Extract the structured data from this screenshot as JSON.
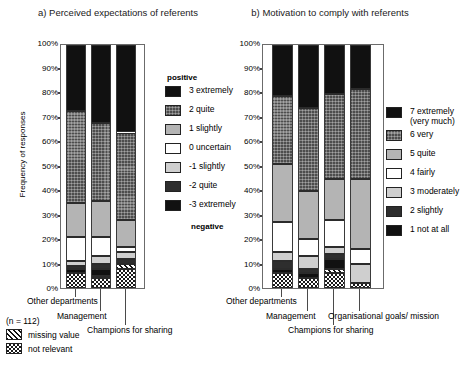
{
  "figure": {
    "y_axis_label": "Frequency of responses",
    "y_ticks": [
      "100%",
      "90%",
      "80%",
      "70%",
      "60%",
      "50%",
      "40%",
      "30%",
      "20%",
      "10%",
      "0%"
    ],
    "sample_size_note": "(n = 112)",
    "notes": [
      {
        "label": "missing value",
        "pattern": "hatched"
      },
      {
        "label": "not relevant",
        "pattern": "checkerboard"
      }
    ]
  },
  "panel_a": {
    "title": "a) Perceived expectations of referents",
    "legend": {
      "header": "positive",
      "footer": "negative",
      "items": [
        {
          "label": "3 extremely",
          "fill": "black"
        },
        {
          "label": "2 quite",
          "fill": "darkgray"
        },
        {
          "label": "1 slightly",
          "fill": "lightgray"
        },
        {
          "label": "0 uncertain",
          "fill": "white"
        },
        {
          "label": "-1 slightly",
          "fill": "paleglray"
        },
        {
          "label": "-2 quite",
          "fill": "vdark"
        },
        {
          "label": "-3 extremely",
          "fill": "black"
        }
      ]
    },
    "categories": [
      "Other departments",
      "Management",
      "Champions for sharing"
    ]
  },
  "panel_b": {
    "title": "b) Motivation  to comply with referents",
    "legend": {
      "items": [
        {
          "label": "7 extremely (very much)",
          "fill": "black"
        },
        {
          "label": "6 very",
          "fill": "darkgray"
        },
        {
          "label": "5 quite",
          "fill": "lightgray"
        },
        {
          "label": "4 fairly",
          "fill": "white"
        },
        {
          "label": "3 moderately",
          "fill": "paleglray"
        },
        {
          "label": "2 slightly",
          "fill": "vdark"
        },
        {
          "label": "1 not at all",
          "fill": "black"
        }
      ]
    },
    "categories": [
      "Other departments",
      "Management",
      "Champions for sharing",
      "Organisational goals/ mission"
    ]
  },
  "chart_data": [
    {
      "type": "bar",
      "id": "panel_a",
      "stacked": true,
      "percent": true,
      "title": "a) Perceived expectations of referents",
      "xlabel": "",
      "ylabel": "Frequency of responses",
      "ylim": [
        0,
        100
      ],
      "grid": false,
      "legend_position": "right",
      "legend_header": "positive",
      "legend_footer": "negative",
      "categories": [
        "Other departments",
        "Management",
        "Champions for sharing"
      ],
      "series": [
        {
          "name": "not relevant",
          "fill": "checkerboard",
          "values": [
            6,
            4,
            8
          ]
        },
        {
          "name": "missing value",
          "fill": "hatched",
          "values": [
            0,
            1,
            2
          ]
        },
        {
          "name": "-3 extremely",
          "fill": "black",
          "values": [
            2,
            3,
            0
          ]
        },
        {
          "name": "-2 quite",
          "fill": "vdark",
          "values": [
            1,
            2,
            2
          ]
        },
        {
          "name": "-1 slightly",
          "fill": "paleglray",
          "values": [
            2,
            3,
            3
          ]
        },
        {
          "name": "0 uncertain",
          "fill": "white",
          "values": [
            10,
            8,
            2
          ]
        },
        {
          "name": "1 slightly",
          "fill": "lightgray",
          "values": [
            14,
            15,
            11
          ]
        },
        {
          "name": "2 quite",
          "fill": "darkgray",
          "values": [
            38,
            32,
            36
          ]
        },
        {
          "name": "3 extremely",
          "fill": "black",
          "values": [
            27,
            32,
            36
          ]
        }
      ]
    },
    {
      "type": "bar",
      "id": "panel_b",
      "stacked": true,
      "percent": true,
      "title": "b) Motivation  to comply with referents",
      "xlabel": "",
      "ylabel": "Frequency of responses",
      "ylim": [
        0,
        100
      ],
      "grid": false,
      "legend_position": "right",
      "categories": [
        "Other departments",
        "Management",
        "Champions for sharing",
        "Organisational goals/ mission"
      ],
      "series": [
        {
          "name": "not relevant",
          "fill": "checkerboard",
          "values": [
            6,
            4,
            6,
            2
          ]
        },
        {
          "name": "missing value",
          "fill": "hatched",
          "values": [
            0,
            0,
            2,
            0
          ]
        },
        {
          "name": "1 not at all",
          "fill": "black",
          "values": [
            2,
            2,
            4,
            0
          ]
        },
        {
          "name": "2 slightly",
          "fill": "vdark",
          "values": [
            3,
            2,
            2,
            0
          ]
        },
        {
          "name": "3 moderately",
          "fill": "paleglray",
          "values": [
            4,
            5,
            3,
            8
          ]
        },
        {
          "name": "4 fairly",
          "fill": "white",
          "values": [
            12,
            7,
            11,
            6
          ]
        },
        {
          "name": "5 quite",
          "fill": "lightgray",
          "values": [
            24,
            20,
            17,
            29
          ]
        },
        {
          "name": "6 very",
          "fill": "darkgray",
          "values": [
            28,
            34,
            35,
            37
          ]
        },
        {
          "name": "7 extremely (very much)",
          "fill": "black",
          "values": [
            21,
            26,
            20,
            18
          ]
        }
      ]
    }
  ]
}
